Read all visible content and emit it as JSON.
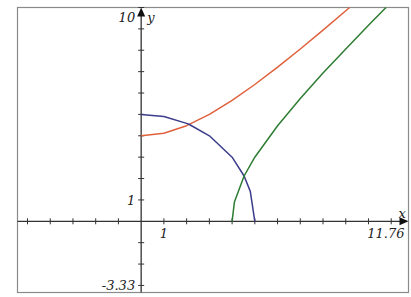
{
  "chart_data": {
    "type": "line",
    "title": "",
    "xlabel": "x",
    "ylabel": "y",
    "xlim": [
      -5.44,
      11.76
    ],
    "ylim": [
      -3.33,
      10
    ],
    "grid": false,
    "tick_step": 1,
    "tick_labels": {
      "xmax": "11.76",
      "ymax": "10",
      "ymin": "-3.33",
      "x_unit": "1",
      "y_unit": "1"
    },
    "series": [
      {
        "name": "red-curve",
        "equation": "y^2 - x^2 = 16",
        "color": "#e0603c",
        "x": [
          0,
          1,
          2,
          3,
          4,
          5,
          6,
          7,
          8,
          9,
          9.17
        ],
        "y": [
          4.0,
          4.12,
          4.47,
          5.0,
          5.66,
          6.4,
          7.21,
          8.06,
          8.94,
          9.85,
          10.0
        ]
      },
      {
        "name": "blue-curve",
        "equation": "x^2 + y^2 = 25",
        "color": "#3c3c8c",
        "x": [
          0,
          1,
          2,
          2.12,
          3,
          4,
          4.53,
          4.8,
          5
        ],
        "y": [
          5.0,
          4.9,
          4.58,
          4.53,
          4.0,
          3.0,
          2.12,
          1.4,
          0
        ]
      },
      {
        "name": "green-curve",
        "equation": "x^2 - y^2 = 16",
        "color": "#2e7d32",
        "x": [
          4,
          4.1,
          4.53,
          5,
          6,
          7,
          8,
          9,
          10,
          10.77
        ],
        "y": [
          0,
          0.9,
          2.12,
          3.0,
          4.47,
          5.74,
          6.93,
          8.06,
          9.17,
          10.0
        ]
      }
    ]
  }
}
